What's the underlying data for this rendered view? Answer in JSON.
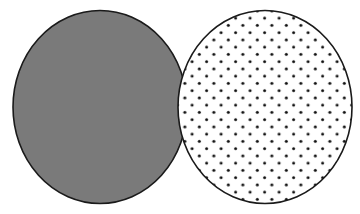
{
  "diagram": {
    "type": "two-overlapping-circles",
    "background": "#ffffff",
    "left_circle": {
      "label": "",
      "fill": "#7a7a7a",
      "stroke": "#1a1a1a",
      "pattern": "solid-gray"
    },
    "right_circle": {
      "label": "",
      "fill": "#ffffff",
      "stroke": "#1a1a1a",
      "pattern": "dotted",
      "dot_color": "#111111"
    },
    "overlap_rendering": "right circle drawn on top"
  }
}
